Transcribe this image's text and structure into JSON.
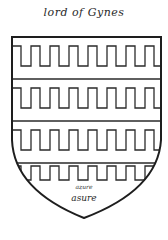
{
  "caption": "lord of Gynes",
  "shield": {
    "blazon_pattern": "barry embattled",
    "bands": 4,
    "teeth_per_band": 8,
    "line_color": "#2a2a2a",
    "field_color": "#ffffff"
  },
  "annotations": {
    "small_label": "azure",
    "tincture_label": "asure"
  }
}
